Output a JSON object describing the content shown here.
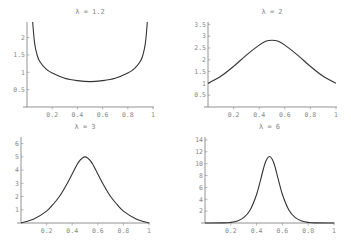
{
  "chart_data": [
    {
      "type": "line",
      "title": "λ = 1.2",
      "xlabel": "",
      "ylabel": "",
      "xlim": [
        0,
        1
      ],
      "ylim": [
        0,
        2.45
      ],
      "xticks": [
        "0.2",
        "0.4",
        "0.6",
        "0.8",
        "1"
      ],
      "xtick_values": [
        0.2,
        0.4,
        0.6,
        0.8,
        1
      ],
      "yticks": [
        "0.5",
        "1",
        "1.5",
        "2"
      ],
      "ytick_values": [
        0.5,
        1,
        1.5,
        2
      ],
      "series": [
        {
          "name": "λ = 1.2",
          "x": [
            0.045,
            0.06,
            0.08,
            0.1,
            0.15,
            0.2,
            0.3,
            0.4,
            0.5,
            0.6,
            0.7,
            0.8,
            0.85,
            0.9,
            0.92,
            0.94,
            0.955
          ],
          "y": [
            2.45,
            1.85,
            1.5,
            1.32,
            1.1,
            0.98,
            0.83,
            0.76,
            0.73,
            0.76,
            0.83,
            0.98,
            1.1,
            1.32,
            1.5,
            1.85,
            2.45
          ]
        }
      ]
    },
    {
      "type": "line",
      "title": "λ = 2",
      "xlabel": "",
      "ylabel": "",
      "xlim": [
        0,
        1
      ],
      "ylim": [
        0,
        3.6
      ],
      "xticks": [
        "0.2",
        "0.4",
        "0.6",
        "0.8",
        "1"
      ],
      "xtick_values": [
        0.2,
        0.4,
        0.6,
        0.8,
        1
      ],
      "yticks": [
        "0.5",
        "1",
        "1.5",
        "2",
        "2.5",
        "3",
        "3.5"
      ],
      "ytick_values": [
        0.5,
        1,
        1.5,
        2,
        2.5,
        3,
        3.5
      ],
      "series": [
        {
          "name": "λ = 2",
          "x": [
            0,
            0.1,
            0.2,
            0.3,
            0.4,
            0.45,
            0.5,
            0.55,
            0.6,
            0.7,
            0.8,
            0.9,
            1
          ],
          "y": [
            1.0,
            1.3,
            1.72,
            2.2,
            2.62,
            2.78,
            2.83,
            2.78,
            2.62,
            2.2,
            1.72,
            1.3,
            1.0
          ]
        }
      ]
    },
    {
      "type": "line",
      "title": "λ = 3",
      "xlabel": "",
      "ylabel": "",
      "xlim": [
        0,
        1
      ],
      "ylim": [
        0,
        6.5
      ],
      "xticks": [
        "0.2",
        "0.4",
        "0.6",
        "0.8",
        "1"
      ],
      "xtick_values": [
        0.2,
        0.4,
        0.6,
        0.8,
        1
      ],
      "yticks": [
        "1",
        "2",
        "3",
        "4",
        "5",
        "6"
      ],
      "ytick_values": [
        1,
        2,
        3,
        4,
        5,
        6
      ],
      "series": [
        {
          "name": "λ = 3",
          "x": [
            0,
            0.1,
            0.2,
            0.25,
            0.3,
            0.35,
            0.4,
            0.45,
            0.5,
            0.55,
            0.6,
            0.65,
            0.7,
            0.75,
            0.8,
            0.9,
            1
          ],
          "y": [
            0,
            0.3,
            0.9,
            1.4,
            2.0,
            2.8,
            3.7,
            4.6,
            5.0,
            4.6,
            3.7,
            2.8,
            2.0,
            1.4,
            0.9,
            0.3,
            0
          ]
        }
      ]
    },
    {
      "type": "line",
      "title": "λ = 6",
      "xlabel": "",
      "ylabel": "",
      "xlim": [
        0,
        1
      ],
      "ylim": [
        0,
        14.5
      ],
      "xticks": [
        "0.2",
        "0.4",
        "0.6",
        "0.8",
        "1"
      ],
      "xtick_values": [
        0.2,
        0.4,
        0.6,
        0.8,
        1
      ],
      "yticks": [
        "2",
        "4",
        "6",
        "8",
        "10",
        "12",
        "14"
      ],
      "ytick_values": [
        2,
        4,
        6,
        8,
        10,
        12,
        14
      ],
      "series": [
        {
          "name": "λ = 6",
          "x": [
            0,
            0.15,
            0.2,
            0.25,
            0.3,
            0.35,
            0.4,
            0.43,
            0.46,
            0.48,
            0.5,
            0.52,
            0.54,
            0.57,
            0.6,
            0.65,
            0.7,
            0.75,
            0.8,
            0.85,
            1
          ],
          "y": [
            0,
            0.02,
            0.1,
            0.35,
            0.9,
            2.2,
            4.8,
            7.2,
            9.7,
            10.8,
            11.2,
            10.8,
            9.7,
            7.2,
            4.8,
            2.2,
            0.9,
            0.35,
            0.1,
            0.02,
            0
          ]
        }
      ]
    }
  ]
}
